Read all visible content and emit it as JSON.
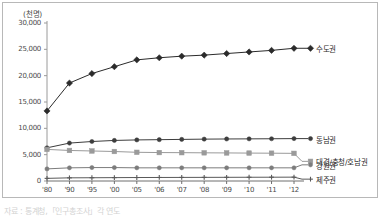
{
  "chart_data": {
    "type": "line",
    "title": "",
    "subtitle": "",
    "unit_label": "(천명)",
    "xlabel": "",
    "ylabel": "",
    "ylim": [
      0,
      30000
    ],
    "ytick_step": 5000,
    "grid": false,
    "legend_position": "right-inline",
    "categories": [
      "'80",
      "'90",
      "'95",
      "'00",
      "'05",
      "'06",
      "'07",
      "'08",
      "'09",
      "'10",
      "'11",
      "'12"
    ],
    "ytick_labels": [
      "30,000",
      "25,000",
      "20,000",
      "15,000",
      "10,000",
      "5,000",
      "0"
    ],
    "ytick_values": [
      30000,
      25000,
      20000,
      15000,
      10000,
      5000,
      0
    ],
    "series": [
      {
        "name": "수도권",
        "color": "#2b2b2b",
        "marker": "diamond",
        "values": [
          13300,
          18600,
          20400,
          21700,
          23000,
          23400,
          23700,
          23900,
          24200,
          24500,
          24800,
          25200
        ]
      },
      {
        "name": "동남권",
        "color": "#3d3d3d",
        "marker": "circle",
        "values": [
          6300,
          7200,
          7500,
          7700,
          7800,
          7850,
          7900,
          7950,
          7980,
          8000,
          8020,
          8050
        ]
      },
      {
        "name": "대경/충청/호남권",
        "color": "#9a9a9a",
        "marker": "square",
        "values": [
          6000,
          5800,
          5700,
          5600,
          5450,
          5400,
          5380,
          5350,
          5330,
          5300,
          5280,
          5250
        ]
      },
      {
        "name": "강원권",
        "color": "#7c7c7c",
        "marker": "circle",
        "values": [
          2300,
          2500,
          2550,
          2550,
          2500,
          2500,
          2500,
          2500,
          2500,
          2500,
          2500,
          2500
        ]
      },
      {
        "name": "제주권",
        "color": "#5a5a5a",
        "marker": "plus",
        "values": [
          500,
          600,
          620,
          640,
          660,
          670,
          680,
          690,
          700,
          710,
          720,
          730
        ]
      }
    ]
  },
  "caption": {
    "text": "자료 : 통계청,「인구총조사」각 연도"
  }
}
